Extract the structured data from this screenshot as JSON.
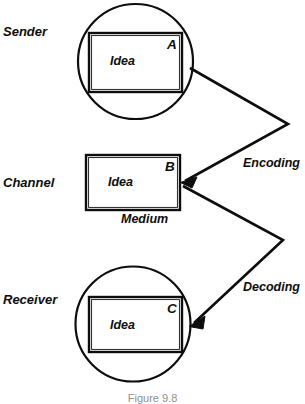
{
  "diagram": {
    "caption": "Figure 9.8",
    "ink_color": "#0d0d0d",
    "background_color": "#ffffff",
    "caption_color": "#8f8f8f",
    "stages": [
      {
        "id": "sender",
        "label": "Sender",
        "shape": "circle",
        "box_letter": "A",
        "box_text": "Idea"
      },
      {
        "id": "channel",
        "label": "Channel",
        "shape": "rectangle",
        "box_letter": "B",
        "box_text": "Idea",
        "sub_label": "Medium"
      },
      {
        "id": "receiver",
        "label": "Receiver",
        "shape": "circle",
        "box_letter": "C",
        "box_text": "Idea"
      }
    ],
    "connectors": [
      {
        "id": "encoding",
        "label": "Encoding",
        "from": "sender",
        "to": "channel",
        "style": "zigzag-arrow"
      },
      {
        "id": "decoding",
        "label": "Decoding",
        "from": "channel",
        "to": "receiver",
        "style": "zigzag-arrow"
      }
    ]
  }
}
